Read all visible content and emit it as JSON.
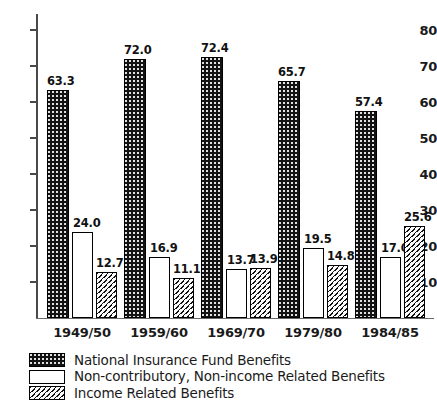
{
  "chart_data": {
    "type": "bar",
    "title": "",
    "subtitle": "",
    "xlabel": "",
    "ylabel": "",
    "ylim": [
      0,
      85
    ],
    "yticks": [
      10,
      20,
      30,
      40,
      50,
      60,
      70,
      80
    ],
    "grid": false,
    "legend_position": "bottom-left",
    "categories": [
      "1949/50",
      "1959/60",
      "1969/70",
      "1979/80",
      "1984/85"
    ],
    "series": [
      {
        "name": "National Insurance Fund Benefits",
        "pattern": "dark-dotted",
        "values": [
          63.3,
          72.0,
          72.4,
          65.7,
          57.4
        ],
        "labels": [
          "63.3",
          "72.0",
          "72.4",
          "65.7",
          "57.4"
        ]
      },
      {
        "name": "Non-contributory, Non-income Related Benefits",
        "pattern": "white-outline",
        "values": [
          24.0,
          16.9,
          13.7,
          19.5,
          17.0
        ],
        "labels": [
          "24.0",
          "16.9",
          "13.7",
          "19.5",
          "17.0"
        ]
      },
      {
        "name": "Income Related Benefits",
        "pattern": "diagonal-hatch",
        "values": [
          12.7,
          11.1,
          13.9,
          14.8,
          25.6
        ],
        "labels": [
          "12.7",
          "11.1",
          "13.9",
          "14.8",
          "25.6"
        ]
      }
    ]
  },
  "axis": {
    "ytick_labels": [
      "80",
      "70",
      "60",
      "50",
      "40",
      "30",
      "20",
      "10"
    ]
  },
  "legend": {
    "items": [
      {
        "label": "National Insurance Fund Benefits"
      },
      {
        "label": "Non-contributory, Non-income Related Benefits"
      },
      {
        "label": "Income Related Benefits"
      }
    ]
  },
  "colors": {
    "axis": "#4a4a4a",
    "text": "#1a1a1a",
    "bar_dark": "#131313",
    "bar_white": "#ffffff",
    "bar_hatch": "#fbfbfb"
  }
}
